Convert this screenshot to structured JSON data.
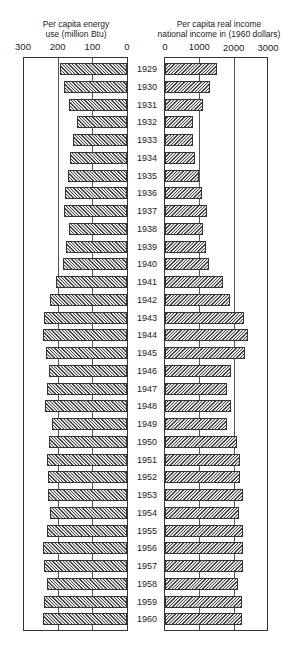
{
  "chart_data": {
    "type": "bar",
    "orientation": "horizontal",
    "layout": "back-to-back (population pyramid style)",
    "categories": [
      "1929",
      "1930",
      "1931",
      "1932",
      "1933",
      "1934",
      "1935",
      "1936",
      "1937",
      "1938",
      "1939",
      "1940",
      "1941",
      "1942",
      "1943",
      "1944",
      "1945",
      "1946",
      "1947",
      "1948",
      "1949",
      "1950",
      "1951",
      "1952",
      "1953",
      "1954",
      "1955",
      "1956",
      "1957",
      "1958",
      "1959",
      "1960"
    ],
    "series": [
      {
        "name": "Per capita energy use (million Btu)",
        "side": "left",
        "axis_ticks": [
          "300",
          "200",
          "100",
          "0"
        ],
        "xlim": [
          0,
          300
        ],
        "gridlines": [
          100,
          200
        ],
        "values": [
          192,
          181,
          166,
          143,
          157,
          163,
          170,
          178,
          183,
          166,
          175,
          186,
          205,
          222,
          239,
          243,
          233,
          226,
          230,
          236,
          217,
          226,
          231,
          228,
          228,
          223,
          232,
          241,
          238,
          231,
          238,
          243
        ]
      },
      {
        "name": "Per capita real income national income in (1960 dollars)",
        "side": "right",
        "axis_ticks": [
          "0",
          "1000",
          "2000",
          "3000"
        ],
        "xlim": [
          0,
          3000
        ],
        "gridlines": [
          1000,
          2000
        ],
        "values": [
          1510,
          1300,
          1120,
          820,
          810,
          880,
          1000,
          1080,
          1220,
          1110,
          1200,
          1290,
          1690,
          1890,
          2300,
          2420,
          2320,
          1920,
          1800,
          1910,
          1800,
          2090,
          2180,
          2170,
          2270,
          2160,
          2260,
          2260,
          2260,
          2140,
          2230,
          2240
        ]
      }
    ],
    "left_title_line1": "Per capita energy",
    "left_title_line2": "use (million Btu)",
    "right_title_line1": "Per capita real income",
    "right_title_line2": "national income in (1960 dollars)",
    "grid": true,
    "legend": "none",
    "colors": {
      "bar_fill": "#e6e6e6",
      "hatch": "#444444",
      "frame": "#333333"
    }
  }
}
